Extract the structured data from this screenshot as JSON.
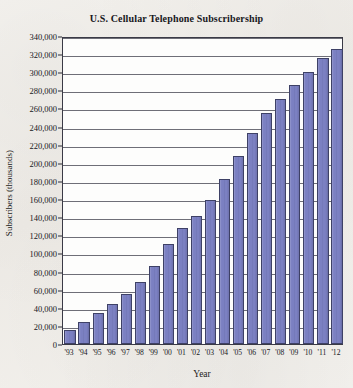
{
  "chart_data": {
    "type": "bar",
    "title": "U.S. Cellular Telephone Subscribership",
    "xlabel": "Year",
    "ylabel": "Subscribers (thousands)",
    "categories": [
      "'93",
      "'94",
      "'95",
      "'96",
      "'97",
      "'98",
      "'99",
      "'00",
      "'01",
      "'02",
      "'03",
      "'04",
      "'05",
      "'06",
      "'07",
      "'08",
      "'09",
      "'10",
      "'11",
      "'12"
    ],
    "values": [
      16000,
      24000,
      34000,
      44000,
      55000,
      69000,
      86000,
      110000,
      128000,
      141000,
      159000,
      182000,
      208000,
      233000,
      255000,
      270000,
      286000,
      300000,
      316000,
      326000
    ],
    "ylim": [
      0,
      340000
    ],
    "ytick_step": 20000,
    "ytick_labels": [
      "340,000",
      "320,000",
      "300,000",
      "280,000",
      "260,000",
      "240,000",
      "220,000",
      "200,000",
      "180,000",
      "160,000",
      "140,000",
      "120,000",
      "100,000",
      "80,000",
      "60,000",
      "40,000",
      "20,000",
      "0"
    ],
    "ytick_values": [
      340000,
      320000,
      300000,
      280000,
      260000,
      240000,
      220000,
      200000,
      180000,
      160000,
      140000,
      120000,
      100000,
      80000,
      60000,
      40000,
      20000,
      0
    ],
    "grid": true,
    "legend": false,
    "bar_color": "#7b80c2",
    "bar_edge_color": "#3e4166",
    "plot_background": "#fdfdfc",
    "page_background": "#f4f2ee",
    "axis_color": "#3a3a46"
  }
}
